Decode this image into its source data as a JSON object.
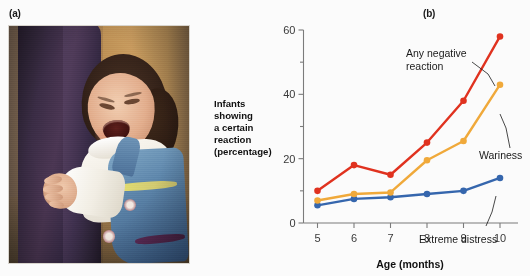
{
  "figure": {
    "panel_a_letter": "(a)",
    "panel_b_letter": "(b)",
    "photo_alt": "crying infant clinging to adult leg"
  },
  "chart_data": {
    "type": "line",
    "title": "",
    "xlabel": "Age (months)",
    "ylabel": "Infants showing a certain reaction (percentage)",
    "ylabel_lines": [
      "Infants",
      "showing",
      "a certain",
      "reaction",
      "(percentage)"
    ],
    "categories": [
      5,
      6,
      7,
      8,
      9,
      10
    ],
    "x": [
      5,
      6,
      7,
      8,
      9,
      10
    ],
    "xtick_labels": [
      "5",
      "6",
      "7",
      "8",
      "9",
      "10"
    ],
    "ytick_labels": [
      "0",
      "20",
      "40",
      "60"
    ],
    "yticks_major": [
      0,
      20,
      40,
      60
    ],
    "yticks_minor": [
      10,
      30,
      50
    ],
    "ylim": [
      0,
      60
    ],
    "xlim": [
      5,
      10
    ],
    "grid": false,
    "legend": "annotations",
    "series": [
      {
        "name": "Any negative reaction",
        "color": "#e0321f",
        "values": [
          10,
          18,
          15,
          25,
          38,
          58
        ]
      },
      {
        "name": "Wariness",
        "color": "#f0a93a",
        "values": [
          7,
          9,
          9.5,
          19.5,
          25.5,
          43
        ]
      },
      {
        "name": "Extreme distress",
        "color": "#3566ad",
        "values": [
          5.5,
          7.5,
          8,
          9,
          10,
          14
        ]
      }
    ],
    "annotations": [
      {
        "text_lines": [
          "Any negative",
          "reaction"
        ],
        "target_series": "Any negative reaction"
      },
      {
        "text_lines": [
          "Wariness"
        ],
        "target_series": "Wariness"
      },
      {
        "text_lines": [
          "Extreme distress"
        ],
        "target_series": "Extreme distress"
      }
    ]
  }
}
